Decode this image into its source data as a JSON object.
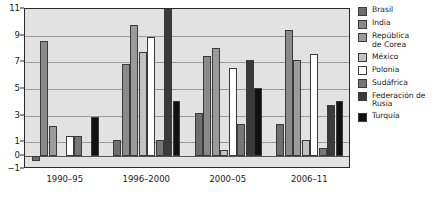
{
  "chart_data": {
    "type": "bar",
    "title": "",
    "subtitle": "",
    "xlabel": "",
    "ylabel": "",
    "categories": [
      "1990–95",
      "1996–2000",
      "2000–05",
      "2006–11"
    ],
    "ylim": [
      -1,
      11
    ],
    "yticks": [
      -1,
      0,
      1,
      3,
      5,
      7,
      9,
      11
    ],
    "ytick_labels": [
      "−1",
      "0",
      "1",
      "3",
      "5",
      "7",
      "9",
      "11"
    ],
    "grid": true,
    "legend_position": "right",
    "series": [
      {
        "name": "Brasil",
        "color": "#6e6e6e",
        "values": [
          -0.4,
          1.2,
          3.2,
          2.4
        ]
      },
      {
        "name": "India",
        "color": "#8a8a8a",
        "values": [
          8.6,
          6.9,
          7.5,
          9.4
        ]
      },
      {
        "name": "República de Corea",
        "color": "#9b9b9b",
        "values": [
          2.2,
          9.8,
          8.1,
          7.2
        ]
      },
      {
        "name": "México",
        "color": "#c2c2c2",
        "values": [
          0,
          7.8,
          0.4,
          1.2
        ]
      },
      {
        "name": "Polonia",
        "color": "#ffffff",
        "values": [
          1.5,
          8.9,
          6.6,
          7.6
        ]
      },
      {
        "name": "Sudáfrica",
        "color": "#777777",
        "values": [
          1.5,
          1.2,
          2.4,
          0.6
        ]
      },
      {
        "name": "Federación de Rusia",
        "color": "#3a3a3a",
        "values": [
          0,
          11.3,
          7.2,
          3.8
        ]
      },
      {
        "name": "Turquía",
        "color": "#111111",
        "values": [
          2.9,
          4.1,
          5.1,
          4.1
        ]
      }
    ]
  },
  "legend": {
    "items": [
      {
        "label": "Brasil",
        "color": "#6e6e6e"
      },
      {
        "label": "India",
        "color": "#8a8a8a"
      },
      {
        "label": "República\nde Corea",
        "color": "#9b9b9b"
      },
      {
        "label": "México",
        "color": "#c2c2c2"
      },
      {
        "label": "Polonia",
        "color": "#ffffff"
      },
      {
        "label": "Sudáfrica",
        "color": "#777777"
      },
      {
        "label": "Federación de\nRusia",
        "color": "#3a3a3a"
      },
      {
        "label": "Turquía",
        "color": "#111111"
      }
    ]
  },
  "colors": {
    "plot_background": "#e2e2e2",
    "page_background": "#ffffff",
    "axis": "#2b2b2b",
    "gridline": "#9a9a9a",
    "text": "#1a1a1a"
  }
}
